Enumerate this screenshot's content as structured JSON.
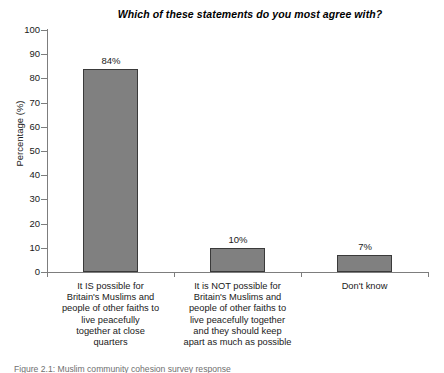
{
  "figure": {
    "caption": "Figure 2.1: Muslim community cohesion survey response"
  },
  "chart_data": {
    "type": "bar",
    "title": "Which of these statements do you most agree with?",
    "xlabel": "",
    "ylabel": "Percentage (%)",
    "ylim": [
      0,
      100
    ],
    "ytick_step": 10,
    "grid": false,
    "legend": null,
    "categories": [
      "It IS possible for Britain's Muslims and people of other faiths to live peacefully together at close quarters",
      "It is NOT possible for Britain's Muslims and people of other faiths to live peacefully together and they should keep apart as much as possible",
      "Don't know"
    ],
    "category_lines": [
      [
        "It IS possible for",
        "Britain's Muslims and",
        "people of other faiths to",
        "live peacefully",
        "together at close",
        "quarters"
      ],
      [
        "It is NOT possible for",
        "Britain's Muslims and",
        "people of other faiths to",
        "live peacefully together",
        "and they should keep",
        "apart as much as possible"
      ],
      [
        "Don't know"
      ]
    ],
    "values": [
      84,
      10,
      7
    ],
    "value_labels": [
      "84%",
      "10%",
      "7%"
    ],
    "yticks": [
      "0",
      "10",
      "20",
      "30",
      "40",
      "50",
      "60",
      "70",
      "80",
      "90",
      "100"
    ],
    "bar_color": "#808080",
    "bar_border_color": "#3a3a3a",
    "axis_color": "#7d7d7d",
    "text_color": "#1a1a1a"
  }
}
